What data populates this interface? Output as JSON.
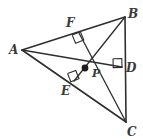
{
  "figure": {
    "kind": "geometry-diagram",
    "background_color": "#ffffff",
    "stroke_color": "#2e2e2e",
    "label_color": "#3a3a3a"
  },
  "points": {
    "A": {
      "label": "A",
      "x": 22,
      "y": 50,
      "label_x": 9,
      "label_y": 44
    },
    "B": {
      "label": "B",
      "x": 125,
      "y": 17,
      "label_x": 128,
      "label_y": 8
    },
    "C": {
      "label": "C",
      "x": 126,
      "y": 122,
      "label_x": 127,
      "label_y": 126
    },
    "D": {
      "label": "D",
      "x": 122,
      "y": 67,
      "label_x": 126,
      "label_y": 62
    },
    "E": {
      "label": "E",
      "x": 74,
      "y": 81,
      "label_x": 61,
      "label_y": 85
    },
    "F": {
      "label": "F",
      "x": 79,
      "y": 33,
      "label_x": 66,
      "label_y": 17
    },
    "P": {
      "label": "P",
      "x": 85,
      "y": 68,
      "label_x": 92,
      "label_y": 68
    }
  },
  "segments": [
    {
      "name": "side-AB",
      "from": "A",
      "to": "B"
    },
    {
      "name": "side-BC",
      "from": "B",
      "to": "C"
    },
    {
      "name": "side-AC",
      "from": "A",
      "to": "C"
    },
    {
      "name": "cevian-A-to-D",
      "from": "A",
      "to": "D"
    },
    {
      "name": "cevian-B-to-E",
      "from": "B",
      "to": "E"
    },
    {
      "name": "cevian-C-to-F",
      "from": "C",
      "to": "F"
    }
  ],
  "right_angle_marks": [
    {
      "name": "right-angle-at-F",
      "vertex": "F",
      "note": "CF perpendicular to AB"
    },
    {
      "name": "right-angle-at-E",
      "vertex": "E",
      "note": "BE perpendicular to AC"
    },
    {
      "name": "right-angle-at-D",
      "vertex": "D",
      "note": "AD perpendicular to BC"
    }
  ],
  "intersection": {
    "name": "orthocenter",
    "label": "P",
    "marker": "filled-dot"
  }
}
